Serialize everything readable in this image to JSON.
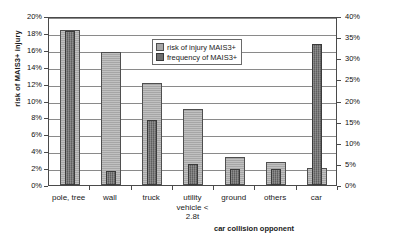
{
  "chart_data": {
    "type": "bar",
    "title": "",
    "xlabel": "car collision opponent",
    "ylabel": "risk of MAIS3+ injury",
    "y2label": "frequency of MAIS3+",
    "categories": [
      "pole, tree",
      "wall",
      "truck",
      "utility\nvehicle <\n2.8t",
      "ground",
      "others",
      "car"
    ],
    "ylim": [
      0,
      20
    ],
    "y2lim": [
      0,
      40
    ],
    "grid": true,
    "legend_position": "top-center",
    "y_ticks": [
      "0%",
      "2%",
      "4%",
      "6%",
      "8%",
      "10%",
      "12%",
      "14%",
      "16%",
      "18%",
      "20%"
    ],
    "y2_ticks": [
      "0%",
      "5%",
      "10%",
      "15%",
      "20%",
      "25%",
      "30%",
      "35%",
      "40%"
    ],
    "series": [
      {
        "name": "risk of injury MAIS3+",
        "axis": "left",
        "unit": "%",
        "values": [
          18.3,
          15.8,
          12.1,
          9.0,
          3.3,
          2.7,
          2.0
        ]
      },
      {
        "name": "frequency of MAIS3+",
        "axis": "right",
        "unit": "%",
        "values": [
          36.5,
          3.3,
          15.4,
          5.0,
          3.8,
          3.9,
          33.4
        ]
      }
    ]
  },
  "legend": {
    "items": [
      {
        "label": "risk of injury MAIS3+",
        "swatch": "risk"
      },
      {
        "label": "frequency of MAIS3+",
        "swatch": "freq"
      }
    ]
  }
}
